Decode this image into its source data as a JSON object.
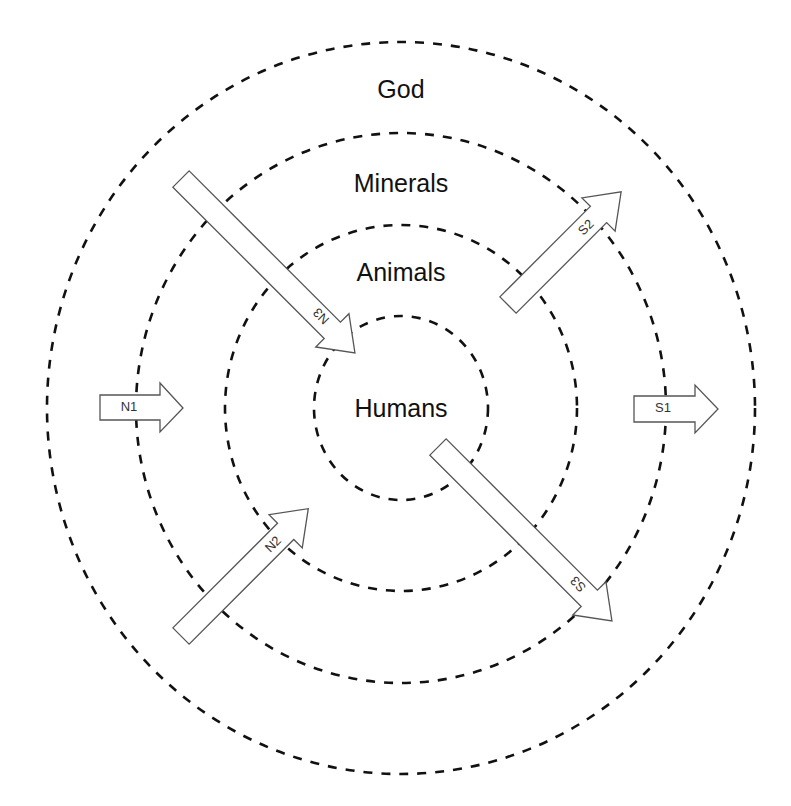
{
  "diagram": {
    "type": "concentric-circles-with-arrows",
    "center": {
      "x": 401,
      "y": 408
    },
    "rings": [
      {
        "id": "god",
        "label": "God",
        "rx": 354,
        "ry": 366,
        "label_y": 98
      },
      {
        "id": "minerals",
        "label": "Minerals",
        "rx": 265,
        "ry": 275,
        "label_y": 192
      },
      {
        "id": "animals",
        "label": "Animals",
        "rx": 176,
        "ry": 183,
        "label_y": 281
      },
      {
        "id": "humans",
        "label": "Humans",
        "rx": 87,
        "ry": 92,
        "label_y": 417
      }
    ],
    "arrows": [
      {
        "id": "N1",
        "label": "N1",
        "direction": "east",
        "from": "god-ring",
        "to": "minerals-ring"
      },
      {
        "id": "N2",
        "label": "N2",
        "direction": "north-east",
        "from": "god-ring",
        "to": "animals-ring"
      },
      {
        "id": "N3",
        "label": "N3",
        "direction": "south-east",
        "from": "god-ring",
        "to": "humans-ring"
      },
      {
        "id": "S1",
        "label": "S1",
        "direction": "east",
        "from": "minerals-ring",
        "to": "god-ring"
      },
      {
        "id": "S2",
        "label": "S2",
        "direction": "north-east",
        "from": "animals-ring",
        "to": "god-ring"
      },
      {
        "id": "S3",
        "label": "S3",
        "direction": "south-east",
        "from": "humans-ring",
        "to": "god-ring"
      }
    ],
    "colors": {
      "ring_stroke": "#111111",
      "arrow_stroke": "#555555",
      "background": "#ffffff"
    }
  }
}
